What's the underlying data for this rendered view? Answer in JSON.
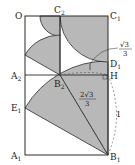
{
  "diagram": {
    "type": "geometry",
    "colors": {
      "shade": "#b8b8b8",
      "line": "#2a2a2a",
      "background": "#ffffff"
    },
    "points": {
      "O": {
        "label": "O",
        "sub": ""
      },
      "C2": {
        "label": "C",
        "sub": "2"
      },
      "C1": {
        "label": "C",
        "sub": "1"
      },
      "D1": {
        "label": "D",
        "sub": "1"
      },
      "H": {
        "label": "H",
        "sub": ""
      },
      "A2": {
        "label": "A",
        "sub": "2"
      },
      "B2": {
        "label": "B",
        "sub": "2"
      },
      "E1": {
        "label": "E",
        "sub": "1"
      },
      "A1": {
        "label": "A",
        "sub": "1"
      },
      "B1": {
        "label": "B",
        "sub": "1"
      }
    },
    "annotations": {
      "sqrt3_over_3": {
        "num": "√3",
        "den": "3"
      },
      "two_sqrt3_over_3": {
        "num": "2√3",
        "den": "3"
      },
      "one": "1"
    }
  }
}
